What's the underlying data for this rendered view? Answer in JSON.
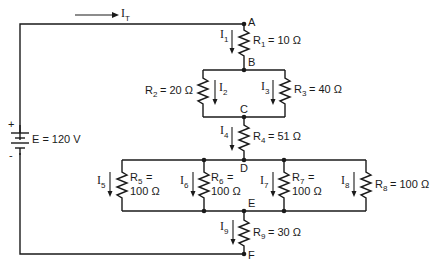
{
  "diagram": {
    "type": "series-parallel circuit",
    "total_current_label": "I",
    "total_current_sub": "T",
    "source": {
      "label": "E = 120 V",
      "plus": "+",
      "minus": "-"
    },
    "nodes": [
      "A",
      "B",
      "C",
      "D",
      "E",
      "F"
    ],
    "resistors": [
      {
        "name": "R",
        "sub": "1",
        "value": "= 10 Ω",
        "current": "I",
        "current_sub": "1"
      },
      {
        "name": "R",
        "sub": "2",
        "value": "= 20 Ω",
        "current": "I",
        "current_sub": "2"
      },
      {
        "name": "R",
        "sub": "3",
        "value": "= 40 Ω",
        "current": "I",
        "current_sub": "3"
      },
      {
        "name": "R",
        "sub": "4",
        "value": "= 51 Ω",
        "current": "I",
        "current_sub": "4"
      },
      {
        "name": "R",
        "sub": "5",
        "value_line1": "=",
        "value_line2": "100 Ω",
        "current": "I",
        "current_sub": "5"
      },
      {
        "name": "R",
        "sub": "6",
        "value_line1": "=",
        "value_line2": "100 Ω",
        "current": "I",
        "current_sub": "6"
      },
      {
        "name": "R",
        "sub": "7",
        "value_line1": "=",
        "value_line2": "100 Ω",
        "current": "I",
        "current_sub": "7"
      },
      {
        "name": "R",
        "sub": "8",
        "value": "= 100 Ω",
        "current": "I",
        "current_sub": "8"
      },
      {
        "name": "R",
        "sub": "9",
        "value": "= 30 Ω",
        "current": "I",
        "current_sub": "9"
      }
    ]
  }
}
